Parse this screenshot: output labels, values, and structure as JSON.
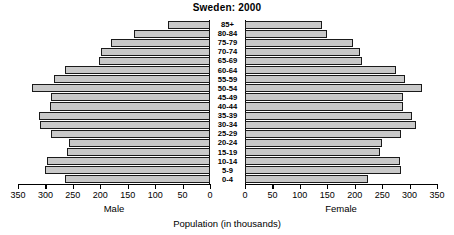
{
  "chart_data": {
    "type": "bar",
    "subtype": "population-pyramid",
    "title": "Sweden: 2000",
    "xlabel": "Population (in thousands)",
    "ylabel": "",
    "categories": [
      "0-4",
      "5-9",
      "10-14",
      "15-19",
      "20-24",
      "25-29",
      "30-34",
      "35-39",
      "40-44",
      "45-49",
      "50-54",
      "55-59",
      "60-64",
      "65-69",
      "70-74",
      "75-79",
      "80-84",
      "85+"
    ],
    "series": [
      {
        "name": "Male",
        "side": "left",
        "axis_direction": "reversed",
        "xlim": [
          0,
          350
        ],
        "ticks": [
          0,
          50,
          100,
          150,
          200,
          250,
          300,
          350
        ],
        "values": [
          264,
          300,
          297,
          260,
          257,
          289,
          310,
          312,
          292,
          290,
          325,
          284,
          265,
          202,
          198,
          181,
          139,
          76
        ]
      },
      {
        "name": "Female",
        "side": "right",
        "axis_direction": "normal",
        "xlim": [
          0,
          350
        ],
        "ticks": [
          0,
          50,
          100,
          150,
          200,
          250,
          300,
          350
        ],
        "values": [
          224,
          285,
          282,
          247,
          250,
          285,
          311,
          304,
          288,
          288,
          322,
          292,
          275,
          213,
          210,
          197,
          150,
          140
        ]
      }
    ],
    "grid": false,
    "legend_position": "below-axes",
    "units": "thousands"
  },
  "chart": {
    "title": "Sweden: 2000",
    "axis_title": "Population (in thousands)",
    "male_caption": "Male",
    "female_caption": "Female",
    "tick_labels_male": [
      "350",
      "300",
      "250",
      "200",
      "150",
      "100",
      "50",
      "0"
    ],
    "tick_labels_female": [
      "0",
      "50",
      "100",
      "150",
      "200",
      "250",
      "300",
      "350"
    ],
    "age_groups": [
      "85+",
      "80-84",
      "75-79",
      "70-74",
      "65-69",
      "60-64",
      "55-59",
      "50-54",
      "45-49",
      "40-44",
      "35-39",
      "30-34",
      "25-29",
      "20-24",
      "15-19",
      "10-14",
      "5-9",
      "0-4"
    ],
    "colors": {
      "bar_fill": "#c9c9c9",
      "bar_border": "#1a1a1a",
      "axis": "#000000",
      "background": "#ffffff"
    }
  }
}
